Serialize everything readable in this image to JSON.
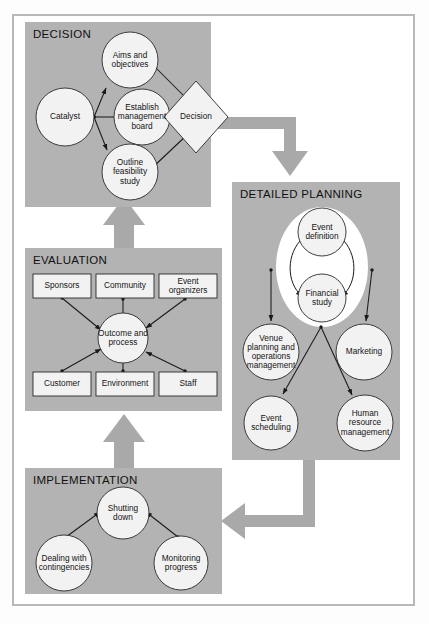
{
  "figure": {
    "background": "#ffffff",
    "frame_color": "#b9b9b9",
    "panel_fill": "#b3b3b3",
    "node_fill": "#f2f2f2",
    "flow_arrow_color": "#a9a9a9"
  },
  "panels": [
    {
      "id": "decision",
      "title": "DECISION"
    },
    {
      "id": "detailed",
      "title": "DETAILED PLANNING"
    },
    {
      "id": "evaluation",
      "title": "EVALUATION"
    },
    {
      "id": "implementation",
      "title": "IMPLEMENTATION"
    }
  ],
  "decision": {
    "title": "DECISION",
    "nodes": [
      {
        "id": "catalyst",
        "label": "Catalyst",
        "shape": "circle"
      },
      {
        "id": "aims",
        "label": "Aims\nand\nobjectives",
        "shape": "circle"
      },
      {
        "id": "board",
        "label": "Establish\nmanagement\nboard",
        "shape": "circle"
      },
      {
        "id": "outline",
        "label": "Outline\nfeasibility\nstudy",
        "shape": "circle"
      },
      {
        "id": "decision",
        "label": "Decision",
        "shape": "diamond"
      }
    ],
    "edges": [
      {
        "from": "catalyst",
        "to": "aims"
      },
      {
        "from": "catalyst",
        "to": "board"
      },
      {
        "from": "catalyst",
        "to": "outline"
      },
      {
        "from": "board",
        "to": "decision"
      },
      {
        "from": "aims",
        "to": "decision"
      },
      {
        "from": "outline",
        "to": "decision"
      }
    ]
  },
  "detailed": {
    "title": "DETAILED PLANNING",
    "nodes": [
      {
        "id": "eventdef",
        "label": "Event\ndefinition",
        "shape": "circle"
      },
      {
        "id": "financial",
        "label": "Financial\nstudy",
        "shape": "circle"
      },
      {
        "id": "venue",
        "label": "Venue\nplanning and\noperations\nmanagement",
        "shape": "circle"
      },
      {
        "id": "marketing",
        "label": "Marketing",
        "shape": "circle"
      },
      {
        "id": "schedule",
        "label": "Event\nscheduling",
        "shape": "circle"
      },
      {
        "id": "hr",
        "label": "Human\nresource\nmanagement",
        "shape": "circle"
      }
    ],
    "edges": [
      {
        "from": "eventdef",
        "to": "financial",
        "style": "curved-bidirectional-left"
      },
      {
        "from": "eventdef",
        "to": "financial",
        "style": "curved-bidirectional-right"
      },
      {
        "from": "core",
        "to": "venue"
      },
      {
        "from": "core",
        "to": "marketing"
      },
      {
        "from": "core",
        "to": "schedule"
      },
      {
        "from": "core",
        "to": "hr"
      }
    ]
  },
  "evaluation": {
    "title": "EVALUATION",
    "centre": {
      "id": "outcome",
      "label": "Outcome\nand\nprocess",
      "shape": "circle"
    },
    "nodes": [
      {
        "id": "sponsors",
        "label": "Sponsors",
        "shape": "rect"
      },
      {
        "id": "community",
        "label": "Community",
        "shape": "rect"
      },
      {
        "id": "organizers",
        "label": "Event\norganizers",
        "shape": "rect"
      },
      {
        "id": "customer",
        "label": "Customer",
        "shape": "rect"
      },
      {
        "id": "environment",
        "label": "Environment",
        "shape": "rect"
      },
      {
        "id": "staff",
        "label": "Staff",
        "shape": "rect"
      }
    ],
    "edges": [
      {
        "from": "sponsors",
        "to": "outcome"
      },
      {
        "from": "community",
        "to": "outcome"
      },
      {
        "from": "organizers",
        "to": "outcome"
      },
      {
        "from": "customer",
        "to": "outcome"
      },
      {
        "from": "environment",
        "to": "outcome"
      },
      {
        "from": "staff",
        "to": "outcome"
      }
    ]
  },
  "implementation": {
    "title": "IMPLEMENTATION",
    "nodes": [
      {
        "id": "shutting",
        "label": "Shutting\ndown",
        "shape": "circle"
      },
      {
        "id": "dealing",
        "label": "Dealing\nwith\ncontingencies",
        "shape": "circle"
      },
      {
        "id": "monitoring",
        "label": "Monitoring\nprogress",
        "shape": "circle"
      }
    ],
    "edges": [
      {
        "from": "dealing",
        "to": "shutting"
      },
      {
        "from": "monitoring",
        "to": "shutting"
      }
    ]
  },
  "flows": [
    {
      "id": "decision-to-detailed",
      "from": "decision",
      "to": "detailed",
      "direction": "right-then-down"
    },
    {
      "id": "detailed-to-implementation",
      "from": "detailed",
      "to": "implementation",
      "direction": "down-then-left"
    },
    {
      "id": "implementation-to-evaluation",
      "from": "implementation",
      "to": "evaluation",
      "direction": "up"
    },
    {
      "id": "evaluation-to-decision",
      "from": "evaluation",
      "to": "decision",
      "direction": "up"
    }
  ]
}
